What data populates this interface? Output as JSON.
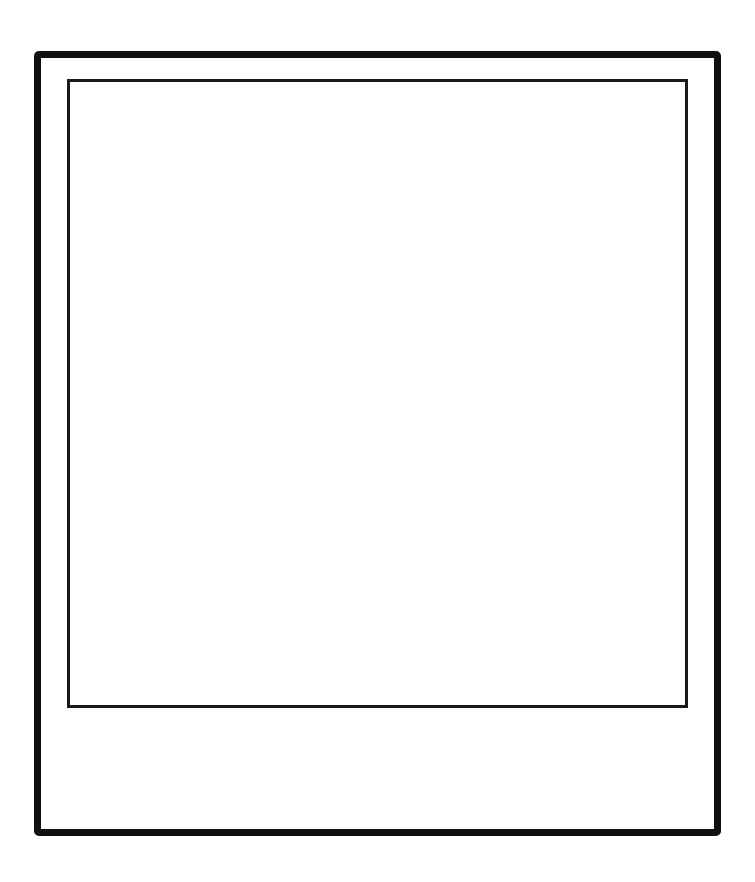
{
  "frame": {
    "type": "instant-photo-frame",
    "outer_border_color": "#111111",
    "inner_border_color": "#1a1a1a",
    "background_color": "#ffffff"
  },
  "photo": {
    "content": ""
  },
  "caption": {
    "text": ""
  }
}
